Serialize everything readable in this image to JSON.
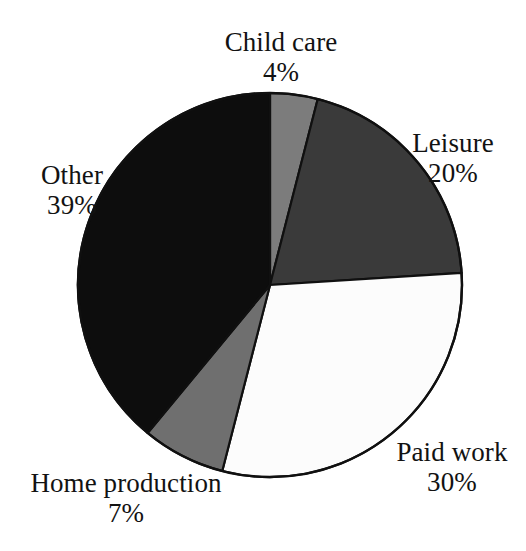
{
  "figure": {
    "background_color": "#ffffff",
    "outline_color": "#101010"
  },
  "chart_data": {
    "type": "pie",
    "title": "",
    "subtitle": "",
    "xlabel": "",
    "ylabel": "",
    "legend_position": "none",
    "grid": false,
    "units": "percent",
    "start_angle_deg": 0,
    "direction": "clockwise",
    "categories": [
      "Child care",
      "Leisure",
      "Paid work",
      "Home production",
      "Other"
    ],
    "values": [
      4,
      20,
      30,
      7,
      39
    ],
    "labels": [
      "4%",
      "20%",
      "30%",
      "7%",
      "39%"
    ],
    "colors": [
      "#7c7c7c",
      "#3a3a3a",
      "#fcfcfc",
      "#6f6f6f",
      "#0d0d0d"
    ],
    "slices": [
      {
        "name": "Child care",
        "value": 4,
        "value_label": "4%",
        "color": "#7c7c7c",
        "start_angle_deg": 0,
        "end_angle_deg": 14.4,
        "label_position": "top"
      },
      {
        "name": "Leisure",
        "value": 20,
        "value_label": "20%",
        "color": "#3a3a3a",
        "start_angle_deg": 14.4,
        "end_angle_deg": 86.4,
        "label_position": "right-upper"
      },
      {
        "name": "Paid work",
        "value": 30,
        "value_label": "30%",
        "color": "#fcfcfc",
        "start_angle_deg": 86.4,
        "end_angle_deg": 194.4,
        "label_position": "right-lower"
      },
      {
        "name": "Home production",
        "value": 7,
        "value_label": "7%",
        "color": "#6f6f6f",
        "start_angle_deg": 194.4,
        "end_angle_deg": 219.6,
        "label_position": "bottom-left"
      },
      {
        "name": "Other",
        "value": 39,
        "value_label": "39%",
        "color": "#0d0d0d",
        "start_angle_deg": 219.6,
        "end_angle_deg": 360,
        "label_position": "left"
      }
    ],
    "total": 100
  },
  "geometry": {
    "center_x": 270,
    "center_y": 285,
    "radius": 192
  }
}
